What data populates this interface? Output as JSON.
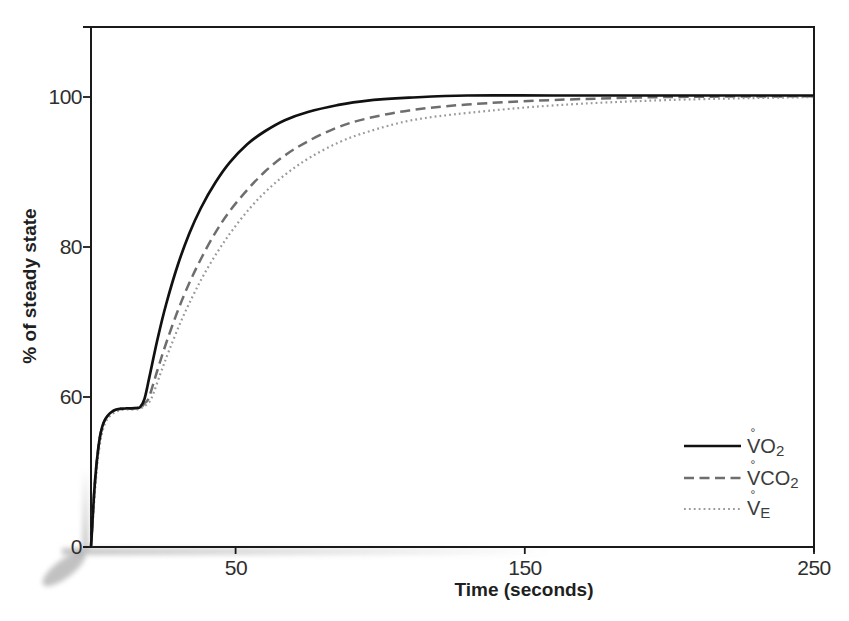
{
  "figure": {
    "background": "#ffffff",
    "axis_color": "#1a1a1a",
    "text_color": "#2e2e2e",
    "x_axis_label": "Time (seconds)",
    "y_axis_label": "% of steady state"
  },
  "legend": {
    "position": "lower-right",
    "items": [
      {
        "series": "VO2",
        "v": "V",
        "ring": "°",
        "rest": "O",
        "sub": "2"
      },
      {
        "series": "VCO2",
        "v": "V",
        "ring": "°",
        "rest": "CO",
        "sub": "2"
      },
      {
        "series": "VE",
        "v": "V",
        "ring": "°",
        "rest": "",
        "sub": "E"
      }
    ]
  },
  "chart_data": {
    "type": "line",
    "title": "",
    "xlabel": "Time (seconds)",
    "ylabel": "% of steady state",
    "x_ticks": [
      50,
      150,
      250
    ],
    "y_ticks": [
      100,
      80,
      60,
      0
    ],
    "x_range": [
      0,
      250
    ],
    "y_range_displayed": [
      0,
      110
    ],
    "y_scale_note": "y-axis is compressed below 60% (0-60 occupies the same span as a 60-unit stretch would at 1/3 scale)",
    "grid": false,
    "legend_position": "lower-right",
    "series": [
      {
        "name": "VO2",
        "label": "V°O2",
        "style": "solid",
        "color": "#111111",
        "points": [
          [
            0,
            0
          ],
          [
            0.4,
            8
          ],
          [
            0.8,
            16
          ],
          [
            1.2,
            23.5
          ],
          [
            1.7,
            30.5
          ],
          [
            2.3,
            37.5
          ],
          [
            3,
            43.5
          ],
          [
            3.8,
            47.8
          ],
          [
            4.7,
            50.6
          ],
          [
            5.7,
            52.4
          ],
          [
            7,
            53.9
          ],
          [
            8.5,
            54.9
          ],
          [
            10,
            55.3
          ],
          [
            12,
            55.5
          ],
          [
            14,
            55.5
          ],
          [
            16,
            55.7
          ],
          [
            17,
            56
          ],
          [
            18.5,
            59.3
          ],
          [
            20,
            62.3
          ],
          [
            23,
            67.7
          ],
          [
            26,
            72.4
          ],
          [
            30,
            77.6
          ],
          [
            34,
            81.8
          ],
          [
            38,
            85.2
          ],
          [
            43,
            88.6
          ],
          [
            48,
            91.3
          ],
          [
            54,
            93.7
          ],
          [
            60,
            95.4
          ],
          [
            67,
            96.9
          ],
          [
            75,
            98
          ],
          [
            85,
            98.9
          ],
          [
            95,
            99.5
          ],
          [
            110,
            99.9
          ],
          [
            130,
            100.2
          ],
          [
            160,
            100.2
          ],
          [
            200,
            100.2
          ],
          [
            250,
            100.2
          ]
        ]
      },
      {
        "name": "VCO2",
        "label": "V°CO2",
        "style": "dashed",
        "color": "#6e6e6e",
        "points": [
          [
            0,
            0
          ],
          [
            0.4,
            8
          ],
          [
            0.8,
            16
          ],
          [
            1.2,
            23.5
          ],
          [
            1.7,
            30.5
          ],
          [
            2.3,
            37.5
          ],
          [
            3,
            43.5
          ],
          [
            3.8,
            47.8
          ],
          [
            4.7,
            50.6
          ],
          [
            5.7,
            52.4
          ],
          [
            7,
            53.9
          ],
          [
            8.5,
            54.9
          ],
          [
            10,
            55.3
          ],
          [
            12,
            55.5
          ],
          [
            14,
            55.5
          ],
          [
            16,
            55.6
          ],
          [
            17.5,
            56
          ],
          [
            18.5,
            57.5
          ],
          [
            20,
            59.7
          ],
          [
            23,
            63.6
          ],
          [
            26,
            67.2
          ],
          [
            30,
            71.5
          ],
          [
            34,
            75.2
          ],
          [
            38,
            78.4
          ],
          [
            43,
            81.9
          ],
          [
            48,
            84.8
          ],
          [
            54,
            87.6
          ],
          [
            60,
            90
          ],
          [
            67,
            92.2
          ],
          [
            75,
            94.1
          ],
          [
            85,
            95.9
          ],
          [
            95,
            97.1
          ],
          [
            110,
            98.2
          ],
          [
            130,
            99
          ],
          [
            160,
            99.6
          ],
          [
            200,
            100
          ],
          [
            250,
            100.1
          ]
        ]
      },
      {
        "name": "VE",
        "label": "V°E",
        "style": "dotted",
        "color": "#9a9a9a",
        "points": [
          [
            0,
            0
          ],
          [
            0.5,
            7.5
          ],
          [
            0.9,
            15
          ],
          [
            1.4,
            22.5
          ],
          [
            1.9,
            29.5
          ],
          [
            2.5,
            36.5
          ],
          [
            3.3,
            42.5
          ],
          [
            4.1,
            46.9
          ],
          [
            5,
            49.8
          ],
          [
            6,
            51.7
          ],
          [
            7.4,
            53.2
          ],
          [
            9,
            54.3
          ],
          [
            10.5,
            54.8
          ],
          [
            12.5,
            55
          ],
          [
            14.5,
            55
          ],
          [
            16.5,
            55.2
          ],
          [
            18,
            56
          ],
          [
            19.5,
            57.3
          ],
          [
            21,
            59.7
          ],
          [
            24,
            63.1
          ],
          [
            27,
            66.2
          ],
          [
            31,
            70
          ],
          [
            35,
            73.3
          ],
          [
            39,
            76.3
          ],
          [
            44,
            79.5
          ],
          [
            49,
            82.3
          ],
          [
            55,
            85.2
          ],
          [
            61,
            87.6
          ],
          [
            68,
            89.9
          ],
          [
            76,
            92
          ],
          [
            86,
            94
          ],
          [
            96,
            95.4
          ],
          [
            111,
            96.9
          ],
          [
            131,
            97.9
          ],
          [
            161,
            98.9
          ],
          [
            200,
            99.6
          ],
          [
            250,
            100
          ]
        ]
      }
    ]
  }
}
